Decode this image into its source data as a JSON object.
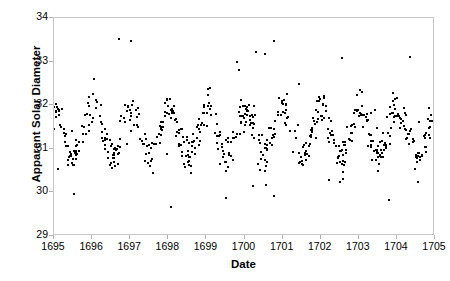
{
  "chart_data": {
    "type": "scatter",
    "title": "",
    "xlabel": "Date",
    "ylabel": "Apparent Solar Diameter",
    "xlim": [
      1695,
      1705
    ],
    "ylim": [
      29,
      34
    ],
    "xticks": [
      "1695",
      "1696",
      "1697",
      "1698",
      "1699",
      "1700",
      "1701",
      "1702",
      "1703",
      "1704",
      "1705"
    ],
    "yticks": [
      "29",
      "30",
      "31",
      "32",
      "33",
      "34"
    ],
    "grid": false,
    "legend": null,
    "marker": {
      "shape": "square",
      "color": "#000000",
      "size_px": 2
    },
    "series": [
      {
        "name": "Apparent solar diameter observations",
        "description": "Annual sinusoidal oscillation, mean ~31.4 arc-min, amplitude ~0.5, period 1 year, maximum near the start of each year, minimum near mid-year, with observational scatter and outliers.",
        "model": {
          "mean": 31.38,
          "amplitude": 0.52,
          "period_years": 1.0,
          "phase_peak_year_fraction": 0.02,
          "noise_sigma": 0.22,
          "outlier_range": [
            29.35,
            33.95
          ],
          "n_points": 620
        }
      }
    ]
  },
  "axes": {
    "y_title": "Apparent Solar Diameter",
    "x_title": "Date"
  }
}
